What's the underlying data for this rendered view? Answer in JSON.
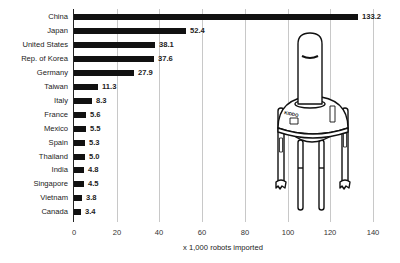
{
  "chart_data": {
    "type": "bar",
    "orientation": "horizontal",
    "title": "",
    "xlabel": "x 1,000 robots imported",
    "ylabel": "",
    "categories": [
      "China",
      "Japan",
      "United States",
      "Rep. of Korea",
      "Germany",
      "Taiwan",
      "Italy",
      "France",
      "Mexico",
      "Spain",
      "Thailand",
      "India",
      "Singapore",
      "Vietnam",
      "Canada"
    ],
    "values": [
      133.2,
      52.4,
      38.1,
      37.6,
      27.9,
      11.3,
      8.3,
      5.6,
      5.5,
      5.3,
      5.0,
      4.8,
      4.5,
      3.8,
      3.4
    ],
    "value_labels": [
      "133.2",
      "52.4",
      "38.1",
      "37.6",
      "27.9",
      "11.3",
      "8.3",
      "5.6",
      "5.5",
      "5.3",
      "5.0",
      "4.8",
      "4.5",
      "3.8",
      "3.4"
    ],
    "xlim": [
      0,
      140
    ],
    "xticks": [
      "0",
      "20",
      "40",
      "60",
      "80",
      "100",
      "120",
      "140"
    ],
    "grid": "vertical",
    "legend": "none",
    "bar_color": "#111111",
    "annotations": [
      "robot illustration labeled KIDDO"
    ]
  },
  "illustration": {
    "robot_label": "KIDDO"
  }
}
